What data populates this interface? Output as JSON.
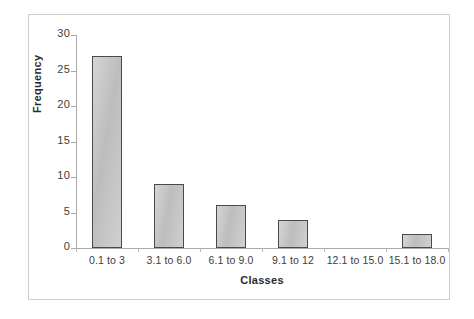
{
  "chart_data": {
    "type": "bar",
    "title": "",
    "subtitle": "",
    "xlabel": "Classes",
    "ylabel": "Frequency",
    "categories": [
      "0.1 to 3",
      "3.1 to 6.0",
      "6.1 to 9.0",
      "9.1 to 12",
      "12.1 to 15.0",
      "15.1 to 18.0"
    ],
    "values": [
      27,
      9,
      6,
      4,
      0,
      2
    ],
    "ylim": [
      0,
      30
    ],
    "ytick_labels": [
      "30",
      "25",
      "20",
      "15",
      "10",
      "5",
      "0"
    ],
    "ytick_values": [
      30,
      25,
      20,
      15,
      10,
      5,
      0
    ],
    "ytick_step": 5,
    "grid": false,
    "legend": false,
    "legend_position": "none",
    "bar_fill_color": "#c3c3c3",
    "bar_border_color": "#4a4a4a",
    "axis_color": "#a9a9a9",
    "frame_color": "#cfcfcf",
    "text_color": "#404040"
  }
}
